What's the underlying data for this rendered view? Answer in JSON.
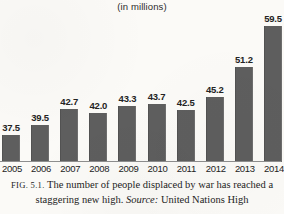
{
  "chart_data": {
    "type": "bar",
    "title": "(in millions)",
    "xlabel": "",
    "ylabel": "",
    "categories": [
      "2005",
      "2006",
      "2007",
      "2008",
      "2009",
      "2010",
      "2011",
      "2012",
      "2013",
      "2014"
    ],
    "values": [
      37.5,
      39.5,
      42.7,
      42.0,
      43.3,
      43.7,
      42.5,
      45.2,
      51.2,
      59.5
    ],
    "value_labels": [
      "37.5",
      "39.5",
      "42.7",
      "42.0",
      "43.3",
      "43.7",
      "42.5",
      "45.2",
      "51.2",
      "59.5"
    ],
    "ylim": [
      32.0,
      62.0
    ],
    "grid": false,
    "legend": false,
    "bar_color": "#5e5e5e",
    "axis_color": "#8e8e8e",
    "background_color": "#fbfaf7"
  },
  "caption": {
    "figure_number": "FIG. 5.1.",
    "text_before_source": "The number of people displaced by war has reached a staggering new high.",
    "source_label": "Source:",
    "source_text": "United Nations High"
  }
}
